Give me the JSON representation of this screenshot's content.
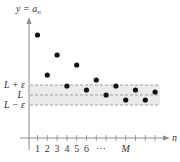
{
  "chart_data": {
    "type": "scatter",
    "title": "",
    "ylabel": "y = a_n",
    "ylabel_parts": {
      "main": "y = a",
      "sub": "n"
    },
    "xlabel": "n",
    "x_tick_labels": [
      "1",
      "2",
      "3",
      "4",
      "5",
      "6",
      "⋯",
      "M"
    ],
    "y_band_labels": {
      "upper": "L + ε",
      "center": "L",
      "lower": "L − ε"
    },
    "band": {
      "upper": 1.0,
      "center": 0.0,
      "lower": -1.0,
      "fill": "#ebebeb"
    },
    "points": [
      {
        "n": 1,
        "a": 6.0
      },
      {
        "n": 2,
        "a": 2.0
      },
      {
        "n": 3,
        "a": 4.0
      },
      {
        "n": 4,
        "a": 0.9
      },
      {
        "n": 5,
        "a": 3.0
      },
      {
        "n": 6,
        "a": 0.5
      },
      {
        "n": 7,
        "a": 1.5
      },
      {
        "n": 8,
        "a": 0.0
      },
      {
        "n": 9,
        "a": 0.9
      },
      {
        "n": 10,
        "a": -0.5
      },
      {
        "n": 11,
        "a": 0.5
      },
      {
        "n": 12,
        "a": -0.5
      },
      {
        "n": 13,
        "a": 0.3
      }
    ],
    "grid": false,
    "legend": null
  }
}
